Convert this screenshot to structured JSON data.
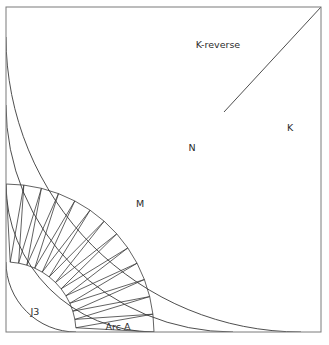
{
  "figure": {
    "background_color": "#ffffff",
    "stroke_color": "#3a3a3a",
    "frame_color": "#7a7a7a",
    "label_color": "#2b2b2b",
    "width": 329,
    "height": 345
  },
  "frame": {
    "x": 6,
    "y": 7,
    "width": 315,
    "height": 325
  },
  "arc_center": {
    "x": 6,
    "y": 332
  },
  "arcs": [
    {
      "name": "inner-j3-arc",
      "radius": 70,
      "label_ref": "J3"
    },
    {
      "name": "arc-a-outer-arc",
      "radius": 148,
      "label_ref": "Arc A"
    },
    {
      "name": "m-n-boundary-arc",
      "radius": 227,
      "label_ref": "M"
    },
    {
      "name": "n-k-boundary-arc",
      "radius": 295,
      "label_ref": "N"
    }
  ],
  "regions": [
    {
      "id": "j3",
      "label": "J3",
      "label_x": 35,
      "label_y": 312
    },
    {
      "id": "arc-a",
      "label": "Arc A",
      "label_x": 118,
      "label_y": 327
    },
    {
      "id": "m",
      "label": "M",
      "label_x": 140,
      "label_y": 204
    },
    {
      "id": "n",
      "label": "N",
      "label_x": 192,
      "label_y": 148
    },
    {
      "id": "k",
      "label": "K",
      "label_x": 290,
      "label_y": 128
    },
    {
      "id": "k-reverse",
      "label": "K-reverse",
      "label_x": 218,
      "label_y": 45
    }
  ],
  "diagonal_ray": {
    "name": "k-divider-ray",
    "from_x": 321,
    "from_y": 7,
    "to_x": 224,
    "to_y": 112
  },
  "triangulation": {
    "name": "arc-a-triangle-strip",
    "band_inner_radius": 70,
    "band_outer_radius": 148,
    "segment_count": 13,
    "start_angle_deg": 0,
    "end_angle_deg": 90
  }
}
